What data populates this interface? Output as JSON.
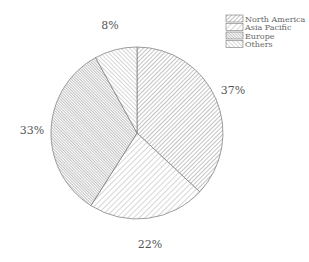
{
  "chart_data": {
    "type": "pie",
    "title": "",
    "start_angle": "12 o'clock",
    "direction": "clockwise",
    "categories": [
      "North America",
      "Asia Pacific",
      "Europe",
      "Others"
    ],
    "values": [
      37,
      22,
      33,
      8
    ],
    "labels": [
      "37%",
      "22%",
      "33%",
      "8%"
    ],
    "legend_position": "top-right",
    "fill": "hatched grayscale patterns"
  },
  "legend": {
    "items": [
      {
        "label": "North America"
      },
      {
        "label": "Asia Pacific"
      },
      {
        "label": "Europe"
      },
      {
        "label": "Others"
      }
    ]
  }
}
